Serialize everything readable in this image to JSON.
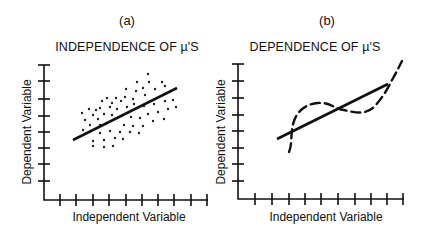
{
  "panels": [
    {
      "id": "a",
      "label": "(a)",
      "title": "INDEPENDENCE OF µ'S",
      "xlabel": "Independent Variable",
      "ylabel": "Dependent Variable",
      "fit_line_style": "solid",
      "residual_pattern": "random scatter"
    },
    {
      "id": "b",
      "label": "(b)",
      "title": "DEPENDENCE OF µ'S",
      "xlabel": "Independent Variable",
      "ylabel": "Dependent Variable",
      "fit_line_style": "solid",
      "residual_pattern": "dashed S-shaped curve crossing fit line"
    }
  ],
  "colors": {
    "ink": "#111111",
    "background": "#ffffff"
  }
}
